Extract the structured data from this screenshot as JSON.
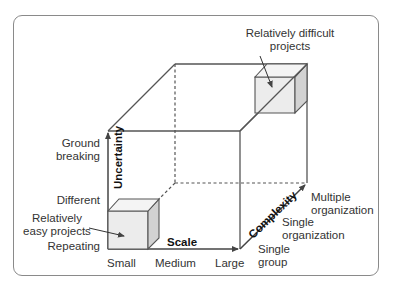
{
  "diagram": {
    "type": "3d-cube-project-classification",
    "axes": {
      "uncertainty": {
        "title": "Uncertainty",
        "levels": [
          "Repeating",
          "Different",
          "Ground breaking"
        ]
      },
      "scale": {
        "title": "Scale",
        "levels": [
          "Small",
          "Medium",
          "Large"
        ]
      },
      "complexity": {
        "title": "Complexity",
        "levels": [
          "Single group",
          "Single organization",
          "Multiple organization"
        ]
      }
    },
    "callouts": {
      "easy": "Relatively easy projects",
      "difficult": "Relatively difficult projects"
    },
    "labels": {
      "ground_breaking_1": "Ground",
      "ground_breaking_2": "breaking",
      "different": "Different",
      "easy_1": "Relatively",
      "easy_2": "easy projects",
      "repeating": "Repeating",
      "small": "Small",
      "medium": "Medium",
      "large": "Large",
      "scale": "Scale",
      "uncertainty": "Uncertainty",
      "complexity": "Complexity",
      "single_group_1": "Single",
      "single_group_2": "group",
      "single_org_1": "Single",
      "single_org_2": "organization",
      "multi_org_1": "Multiple",
      "multi_org_2": "organization",
      "difficult_1": "Relatively difficult",
      "difficult_2": "projects"
    },
    "colors": {
      "line": "#555555",
      "cube_face": "#e8e8e8",
      "cube_side": "#cfcfcf",
      "frame": "#8a8a8a"
    }
  }
}
